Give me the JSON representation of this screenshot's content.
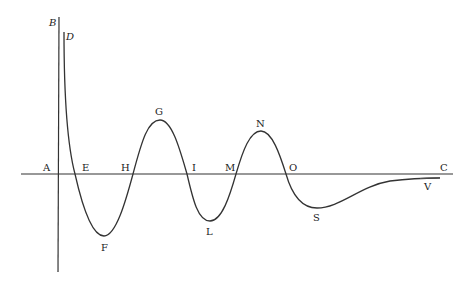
{
  "figure": {
    "axis_horizontal": {
      "start_label": "A",
      "end_label": "C"
    },
    "axis_vertical": {
      "label": "B"
    },
    "curve_start_label": "D",
    "points": [
      {
        "label": "A",
        "x": 43,
        "y": 171,
        "italic": false
      },
      {
        "label": "B",
        "x": 49,
        "y": 26,
        "italic": true
      },
      {
        "label": "D",
        "x": 66,
        "y": 40,
        "italic": true
      },
      {
        "label": "E",
        "x": 82,
        "y": 171,
        "italic": false
      },
      {
        "label": "F",
        "x": 101,
        "y": 251,
        "italic": false
      },
      {
        "label": "H",
        "x": 121,
        "y": 171,
        "italic": false
      },
      {
        "label": "G",
        "x": 155,
        "y": 115,
        "italic": false
      },
      {
        "label": "I",
        "x": 192,
        "y": 171,
        "italic": false
      },
      {
        "label": "L",
        "x": 206,
        "y": 235,
        "italic": false
      },
      {
        "label": "M",
        "x": 225,
        "y": 171,
        "italic": false
      },
      {
        "label": "N",
        "x": 256,
        "y": 127,
        "italic": false
      },
      {
        "label": "O",
        "x": 289,
        "y": 171,
        "italic": false
      },
      {
        "label": "S",
        "x": 313,
        "y": 221,
        "italic": false
      },
      {
        "label": "V",
        "x": 424,
        "y": 190,
        "italic": false
      },
      {
        "label": "C",
        "x": 440,
        "y": 171,
        "italic": false
      }
    ],
    "line_color": "#333333"
  }
}
